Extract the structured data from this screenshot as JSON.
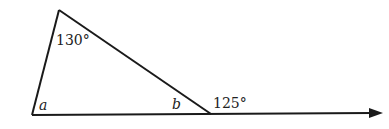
{
  "diagram": {
    "type": "triangle-exterior-angle",
    "labels": {
      "apex_angle": "130°",
      "angle_a": "a",
      "angle_b": "b",
      "exterior_angle": "125°"
    },
    "colors": {
      "line": "#1a1a1a",
      "text": "#222222"
    }
  }
}
